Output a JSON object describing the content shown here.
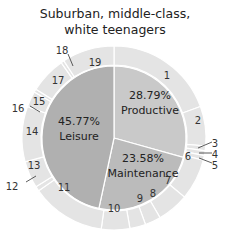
{
  "chart_data": {
    "type": "pie",
    "title": "Suburban, middle-class, white teenagers",
    "inner": [
      {
        "label": "Productive",
        "value": 28.79,
        "pct": "28.79%",
        "color": "#c9c9c9"
      },
      {
        "label": "Maintenance",
        "value": 23.58,
        "pct": "23.58%",
        "color": "#bbbbbb"
      },
      {
        "label": "Leisure",
        "value": 45.77,
        "pct": "45.77%",
        "color": "#b0b0b0"
      }
    ],
    "outer_segments": [
      {
        "label": "1",
        "start": 0,
        "end": 70
      },
      {
        "label": "2",
        "start": 70,
        "end": 95
      },
      {
        "label": "3",
        "start": 95,
        "end": 98
      },
      {
        "label": "4",
        "start": 98,
        "end": 101
      },
      {
        "label": "5",
        "start": 101,
        "end": 104
      },
      {
        "label": "6",
        "start": 104,
        "end": 130
      },
      {
        "label": "7",
        "start": 130,
        "end": 150
      },
      {
        "label": "8",
        "start": 150,
        "end": 160
      },
      {
        "label": "9",
        "start": 160,
        "end": 170
      },
      {
        "label": "10",
        "start": 170,
        "end": 188
      },
      {
        "label": "11",
        "start": 188,
        "end": 235
      },
      {
        "label": "12",
        "start": 235,
        "end": 238
      },
      {
        "label": "13",
        "start": 238,
        "end": 255
      },
      {
        "label": "14",
        "start": 255,
        "end": 290
      },
      {
        "label": "15",
        "start": 290,
        "end": 300
      },
      {
        "label": "16",
        "start": 300,
        "end": 302
      },
      {
        "label": "17",
        "start": 302,
        "end": 325
      },
      {
        "label": "18",
        "start": 325,
        "end": 327
      },
      {
        "label": "19",
        "start": 327,
        "end": 360
      }
    ],
    "outer_color": "#e4e4e4"
  },
  "title": {
    "line1": "Suburban, middle-class,",
    "line2": "white teenagers"
  }
}
